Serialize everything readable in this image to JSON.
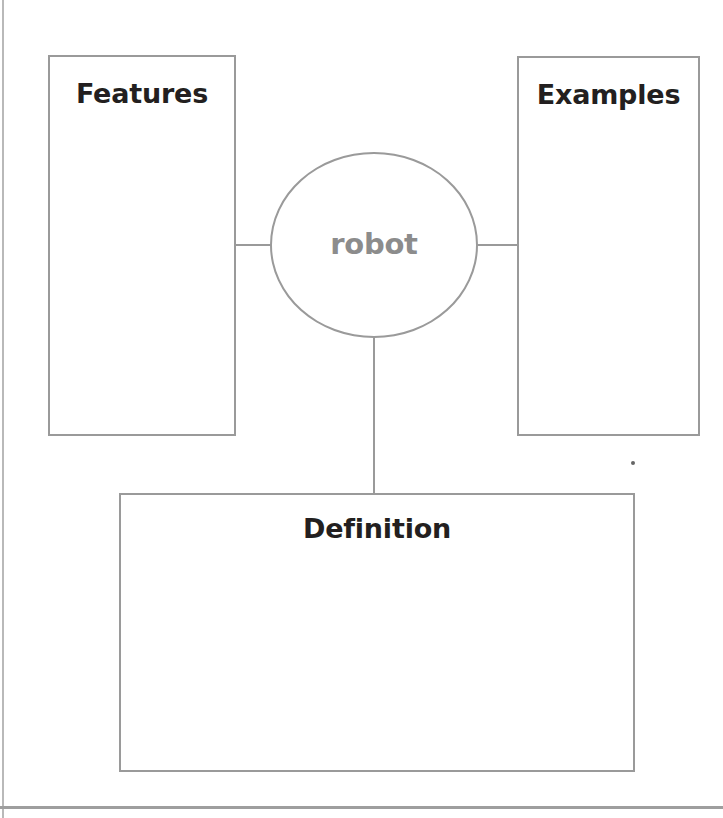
{
  "worksheet": {
    "type": "concept-map",
    "center": {
      "label": "robot",
      "shape": "ellipse",
      "text_color": "#8c8c8c",
      "border_color": "#9a9a9a"
    },
    "boxes": [
      {
        "id": "features",
        "title": "Features",
        "body": ""
      },
      {
        "id": "examples",
        "title": "Examples",
        "body": ""
      },
      {
        "id": "definition",
        "title": "Definition",
        "body": ""
      }
    ],
    "connectors": [
      {
        "from": "features",
        "to": "center",
        "orientation": "horizontal"
      },
      {
        "from": "center",
        "to": "examples",
        "orientation": "horizontal"
      },
      {
        "from": "center",
        "to": "definition",
        "orientation": "vertical"
      }
    ],
    "colors": {
      "border": "#9a9a9a",
      "heading_text": "#231f20",
      "center_text": "#8c8c8c",
      "page_edge": "#b9b9b9",
      "background": "#ffffff"
    }
  }
}
